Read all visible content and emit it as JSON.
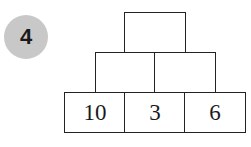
{
  "problem_number": "4",
  "pyramid": {
    "top": [
      ""
    ],
    "middle": [
      "",
      ""
    ],
    "bottom": [
      "10",
      "3",
      "6"
    ]
  }
}
